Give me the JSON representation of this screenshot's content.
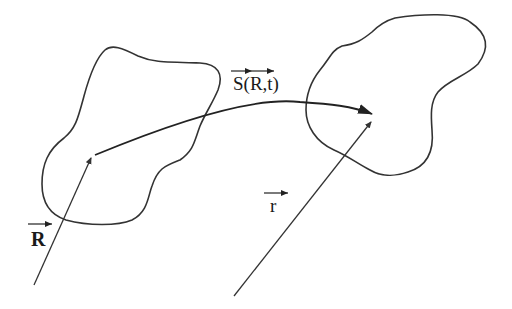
{
  "diagram": {
    "labels": {
      "S": "S(R,t)",
      "R": "R",
      "r": "r"
    },
    "colors": {
      "stroke": "#333333",
      "background": "#ffffff",
      "text": "#1a1a1a"
    },
    "elements": [
      {
        "id": "left-region",
        "kind": "closed-curve"
      },
      {
        "id": "right-region",
        "kind": "closed-curve"
      },
      {
        "id": "vector-R",
        "kind": "arrow",
        "label": "R",
        "bold": true
      },
      {
        "id": "vector-r",
        "kind": "arrow",
        "label": "r"
      },
      {
        "id": "vector-S",
        "kind": "curved-arrow",
        "label": "S(R,t)"
      }
    ]
  }
}
